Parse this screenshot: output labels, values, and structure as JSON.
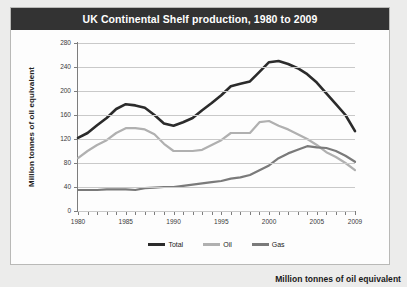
{
  "title": "UK Continental Shelf production, 1980 to 2009",
  "caption": "Million tonnes of oil equivalent",
  "legend": {
    "items": [
      {
        "label": "Total",
        "color": "#2b2b2b"
      },
      {
        "label": "Oil",
        "color": "#b0b0b0"
      },
      {
        "label": "Gas",
        "color": "#7a7a7a"
      }
    ]
  },
  "colors": {
    "title_bar_bg": "#333333",
    "title_bar_text": "#ffffff",
    "panel_bg": "#fdfdfd",
    "page_bg": "#ececeb",
    "gridline": "#c9c9c9",
    "axis": "#7d7d7d",
    "total": "#2b2b2b",
    "oil": "#b0b0b0",
    "gas": "#7a7a7a"
  },
  "chart_data": {
    "type": "line",
    "title": "UK Continental Shelf production, 1980 to 2009",
    "xlabel": "",
    "ylabel": "Million tonnes of oil equivalent",
    "xlim": [
      1980,
      2009
    ],
    "ylim": [
      0,
      280
    ],
    "yticks": [
      0,
      40,
      80,
      120,
      160,
      200,
      240,
      280
    ],
    "xticks": [
      1980,
      1985,
      1990,
      1995,
      2000,
      2005,
      2009
    ],
    "xtick_labels": [
      "1980",
      "1985",
      "1990",
      "1995",
      "2000",
      "2005",
      "2009"
    ],
    "ytick_labels": [
      "0",
      "40",
      "80",
      "120",
      "160",
      "200",
      "240",
      "280"
    ],
    "grid": true,
    "legend_position": "bottom",
    "x": [
      1980,
      1981,
      1982,
      1983,
      1984,
      1985,
      1986,
      1987,
      1988,
      1989,
      1990,
      1991,
      1992,
      1993,
      1994,
      1995,
      1996,
      1997,
      1998,
      1999,
      2000,
      2001,
      2002,
      2003,
      2004,
      2005,
      2006,
      2007,
      2008,
      2009
    ],
    "series": [
      {
        "name": "Total",
        "color": "#2b2b2b",
        "values": [
          122,
          130,
          143,
          155,
          170,
          178,
          176,
          172,
          160,
          146,
          142,
          148,
          155,
          168,
          180,
          193,
          208,
          212,
          216,
          232,
          248,
          250,
          245,
          238,
          228,
          214,
          196,
          178,
          160,
          133
        ]
      },
      {
        "name": "Oil",
        "color": "#b0b0b0",
        "values": [
          88,
          100,
          110,
          118,
          130,
          138,
          138,
          136,
          128,
          112,
          100,
          100,
          100,
          102,
          110,
          118,
          130,
          130,
          130,
          148,
          150,
          142,
          136,
          128,
          120,
          110,
          98,
          90,
          80,
          68
        ]
      },
      {
        "name": "Gas",
        "color": "#7a7a7a",
        "values": [
          35,
          35,
          35,
          36,
          36,
          36,
          35,
          38,
          39,
          40,
          40,
          42,
          44,
          46,
          48,
          50,
          54,
          56,
          60,
          68,
          76,
          88,
          96,
          102,
          108,
          106,
          105,
          100,
          92,
          82
        ]
      }
    ]
  }
}
